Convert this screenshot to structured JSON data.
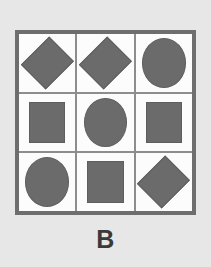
{
  "figure": {
    "label": "B",
    "type": "shape-matrix",
    "rows": 3,
    "columns": 3,
    "colors": {
      "background": "#e7e7e7",
      "panel_background": "#fbfbfb",
      "panel_border": "#6e6e6e",
      "grid_line": "#8d8d8d",
      "shape_fill": "#6b6b6b",
      "shape_stroke": "#5e5e5e",
      "label_color": "#3a3a3a"
    },
    "cells": [
      {
        "row": 1,
        "column": 1,
        "shape": "diamond"
      },
      {
        "row": 1,
        "column": 2,
        "shape": "diamond"
      },
      {
        "row": 1,
        "column": 3,
        "shape": "circle"
      },
      {
        "row": 2,
        "column": 1,
        "shape": "square"
      },
      {
        "row": 2,
        "column": 2,
        "shape": "circle"
      },
      {
        "row": 2,
        "column": 3,
        "shape": "square"
      },
      {
        "row": 3,
        "column": 1,
        "shape": "circle"
      },
      {
        "row": 3,
        "column": 2,
        "shape": "square"
      },
      {
        "row": 3,
        "column": 3,
        "shape": "diamond"
      }
    ]
  }
}
